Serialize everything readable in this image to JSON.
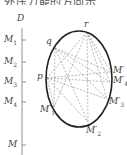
{
  "caption": "外压力能的方向示",
  "axis": {
    "top_label": "D",
    "bottom_label": "M",
    "ticks": [
      {
        "name": "M",
        "sub": "1",
        "y": 40
      },
      {
        "name": "M",
        "sub": "2",
        "y": 62
      },
      {
        "name": "M",
        "sub": "3",
        "y": 82
      },
      {
        "name": "M",
        "sub": "4",
        "y": 102
      }
    ]
  },
  "ellipse_points": {
    "r": "r",
    "q": "q",
    "p": "p",
    "M_prime": "M′",
    "M4_prime": "M′",
    "M4_prime_sub": "4",
    "M3_prime": "M′",
    "M3_prime_sub": "3",
    "M1_prime": "M′",
    "M1_prime_sub": "1",
    "M2_prime": "M′",
    "M2_prime_sub": "2"
  },
  "colors": {
    "curve": "#222222",
    "dashed": "#888888",
    "axis": "#777777"
  }
}
